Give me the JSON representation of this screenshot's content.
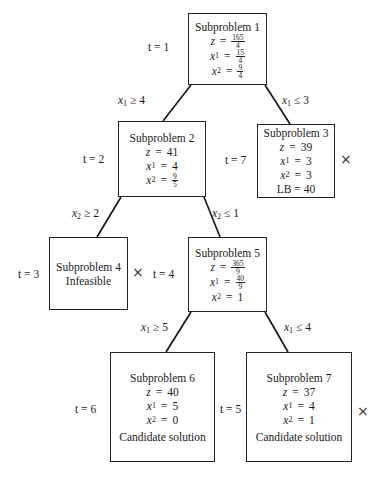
{
  "diagram": {
    "type": "branch-and-bound-tree",
    "nodes": [
      {
        "id": "1",
        "title": "Subproblem 1",
        "t_label": "t = 1",
        "rows": [
          {
            "var": "z",
            "sub": "",
            "value_num": "165",
            "value_den": "4",
            "value": ""
          },
          {
            "var": "x",
            "sub": "1",
            "value_num": "15",
            "value_den": "4",
            "value": ""
          },
          {
            "var": "x",
            "sub": "2",
            "value_num": "9",
            "value_den": "4",
            "value": ""
          }
        ],
        "status": "",
        "lb": "",
        "fathomed": false
      },
      {
        "id": "2",
        "title": "Subproblem 2",
        "t_label": "t = 2",
        "rows": [
          {
            "var": "z",
            "sub": "",
            "value": "41"
          },
          {
            "var": "x",
            "sub": "1",
            "value": "4"
          },
          {
            "var": "x",
            "sub": "2",
            "value_num": "9",
            "value_den": "5",
            "value": ""
          }
        ],
        "status": "",
        "lb": "",
        "fathomed": false
      },
      {
        "id": "3",
        "title": "Subproblem 3",
        "t_label": "t = 7",
        "rows": [
          {
            "var": "z",
            "sub": "",
            "value": "39"
          },
          {
            "var": "x",
            "sub": "1",
            "value": "3"
          },
          {
            "var": "x",
            "sub": "2",
            "value": "3"
          }
        ],
        "status": "",
        "lb": "LB = 40",
        "fathomed": true
      },
      {
        "id": "4",
        "title": "Subproblem 4",
        "t_label": "t = 3",
        "rows": [],
        "status": "Infeasible",
        "lb": "",
        "fathomed": true
      },
      {
        "id": "5",
        "title": "Subproblem 5",
        "t_label": "t = 4",
        "rows": [
          {
            "var": "z",
            "sub": "",
            "value_num": "365",
            "value_den": "9",
            "value": ""
          },
          {
            "var": "x",
            "sub": "1",
            "value_num": "40",
            "value_den": "9",
            "value": ""
          },
          {
            "var": "x",
            "sub": "2",
            "value": "1"
          }
        ],
        "status": "",
        "lb": "",
        "fathomed": false
      },
      {
        "id": "6",
        "title": "Subproblem 6",
        "t_label": "t = 6",
        "rows": [
          {
            "var": "z",
            "sub": "",
            "value": "40"
          },
          {
            "var": "x",
            "sub": "1",
            "value": "5"
          },
          {
            "var": "x",
            "sub": "2",
            "value": "0"
          }
        ],
        "status": "Candidate solution",
        "lb": "",
        "fathomed": false
      },
      {
        "id": "7",
        "title": "Subproblem 7",
        "t_label": "t = 5",
        "rows": [
          {
            "var": "z",
            "sub": "",
            "value": "37"
          },
          {
            "var": "x",
            "sub": "1",
            "value": "4"
          },
          {
            "var": "x",
            "sub": "2",
            "value": "1"
          }
        ],
        "status": "Candidate solution",
        "lb": "",
        "fathomed": true
      }
    ],
    "edges": [
      {
        "from": "1",
        "to": "2",
        "var": "x",
        "sub": "1",
        "op": "≥",
        "bound": "4"
      },
      {
        "from": "1",
        "to": "3",
        "var": "x",
        "sub": "1",
        "op": "≤",
        "bound": "3"
      },
      {
        "from": "2",
        "to": "4",
        "var": "x",
        "sub": "2",
        "op": "≥",
        "bound": "2"
      },
      {
        "from": "2",
        "to": "5",
        "var": "x",
        "sub": "2",
        "op": "≤",
        "bound": "1"
      },
      {
        "from": "5",
        "to": "6",
        "var": "x",
        "sub": "1",
        "op": "≥",
        "bound": "5"
      },
      {
        "from": "5",
        "to": "7",
        "var": "x",
        "sub": "1",
        "op": "≤",
        "bound": "4"
      }
    ],
    "fathom_symbol": "×",
    "t_prefix": "t",
    "eq": "="
  }
}
